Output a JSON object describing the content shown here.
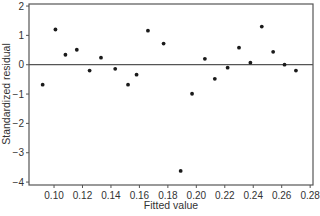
{
  "chart_data": {
    "type": "scatter",
    "title": "",
    "xlabel": "Fitted value",
    "ylabel": "Standardized residual",
    "xlim": [
      0.0824,
      0.282
    ],
    "ylim": [
      -4.1,
      2.07
    ],
    "x_ticks": [
      0.1,
      0.12,
      0.14,
      0.16,
      0.18,
      0.2,
      0.22,
      0.24,
      0.26,
      0.28
    ],
    "x_tick_labels": [
      "0.10",
      "0.12",
      "0.14",
      "0.16",
      "0.18",
      "0.20",
      "0.22",
      "0.24",
      "0.26",
      "0.28"
    ],
    "y_ticks": [
      2,
      1,
      0,
      -1,
      -2,
      -3,
      -4
    ],
    "y_tick_labels": [
      "2",
      "1",
      "0",
      "−1",
      "−2",
      "−3",
      "−4"
    ],
    "reference_line": {
      "y": 0
    },
    "grid": false,
    "legend": null,
    "series": [
      {
        "name": "residuals",
        "x": [
          0.092,
          0.101,
          0.108,
          0.116,
          0.125,
          0.133,
          0.143,
          0.152,
          0.158,
          0.166,
          0.177,
          0.189,
          0.197,
          0.206,
          0.213,
          0.222,
          0.23,
          0.238,
          0.246,
          0.254,
          0.262,
          0.27
        ],
        "y": [
          -0.68,
          1.2,
          0.34,
          0.51,
          -0.2,
          0.24,
          -0.14,
          -0.68,
          -0.34,
          1.16,
          0.72,
          -3.62,
          -0.99,
          0.2,
          -0.48,
          -0.1,
          0.58,
          0.07,
          1.3,
          0.44,
          0.0,
          -0.2
        ]
      }
    ]
  },
  "colors": {
    "axis": "#555555",
    "point": "#1a1a1a",
    "text": "#333333"
  }
}
